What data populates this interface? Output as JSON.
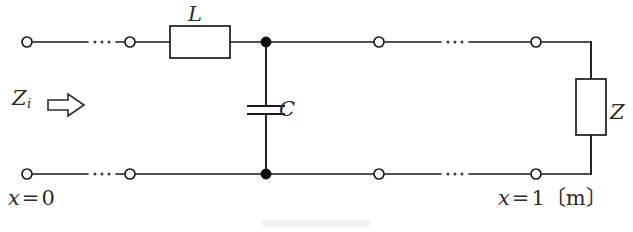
{
  "figure": {
    "type": "circuit-diagram",
    "background_color": "#ffffff",
    "line_color": "#1a1a1a"
  },
  "labels": {
    "inductor": "L",
    "capacitor": "C",
    "load": "Z",
    "input_impedance_symbol": "Z",
    "input_impedance_subscript": "i",
    "input_arrow": "right-open-arrow",
    "position_left_var": "x",
    "position_left_rel": "=",
    "position_left_value": "0",
    "position_right_var": "x",
    "position_right_rel": "=",
    "position_right_value": "1",
    "position_right_unit": "〔m〕",
    "position_left_full": "x = 0",
    "position_right_full": "x = 1〔m〕"
  },
  "components": [
    {
      "name": "inductor-L",
      "kind": "box",
      "label": "L",
      "orientation": "horizontal",
      "x": 170,
      "y": 26,
      "width": 60,
      "height": 32
    },
    {
      "name": "capacitor-C",
      "kind": "parallel-plates",
      "label": "C",
      "orientation": "vertical",
      "center_x": 266,
      "center_y": 110,
      "plate_width": 38,
      "plate_gap": 8
    },
    {
      "name": "load-Z",
      "kind": "box",
      "label": "Z",
      "orientation": "vertical",
      "x": 576,
      "y": 79,
      "width": 30,
      "height": 56
    }
  ],
  "rails": {
    "top_y": 42,
    "bottom_y": 174,
    "left_x": 27,
    "right_x": 591
  },
  "terminals": [
    {
      "name": "terminal-top-left-outer",
      "x": 27,
      "y": 42
    },
    {
      "name": "terminal-top-left-inner",
      "x": 130,
      "y": 42
    },
    {
      "name": "terminal-top-right-inner",
      "x": 379,
      "y": 42
    },
    {
      "name": "terminal-top-right-outer",
      "x": 536,
      "y": 42
    },
    {
      "name": "terminal-bottom-left-outer",
      "x": 27,
      "y": 174
    },
    {
      "name": "terminal-bottom-left-inner",
      "x": 130,
      "y": 174
    },
    {
      "name": "terminal-bottom-right-inner",
      "x": 379,
      "y": 174
    },
    {
      "name": "terminal-bottom-right-outer",
      "x": 536,
      "y": 174
    }
  ],
  "junctions": [
    {
      "name": "junction-top",
      "x": 266,
      "y": 42
    },
    {
      "name": "junction-bottom",
      "x": 266,
      "y": 174
    }
  ],
  "ellipses": [
    {
      "name": "ellipsis-top-left",
      "cx": 102,
      "y": 42,
      "dots": 3
    },
    {
      "name": "ellipsis-top-right",
      "cx": 455,
      "y": 42,
      "dots": 3
    },
    {
      "name": "ellipsis-bottom-left",
      "cx": 102,
      "y": 174,
      "dots": 3
    },
    {
      "name": "ellipsis-bottom-right",
      "cx": 455,
      "y": 174,
      "dots": 3
    }
  ]
}
